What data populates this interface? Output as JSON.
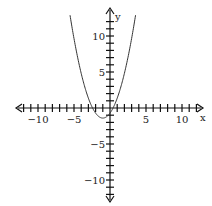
{
  "chart_data": {
    "type": "line",
    "title": "",
    "xlabel": "x",
    "ylabel": "y",
    "xlim": [
      -12,
      12
    ],
    "ylim": [
      -12,
      12
    ],
    "x_tick_labels": [
      "-10",
      "-5",
      "5",
      "10"
    ],
    "y_tick_labels": [
      "10",
      "5",
      "-5",
      "-10"
    ],
    "grid": false,
    "series": [
      {
        "name": "parabola",
        "function": "y = x^2 + 2x - 1",
        "vertex": [
          -1,
          -2
        ],
        "x_intercepts": [
          -2.41,
          0.41
        ],
        "y_intercept": -1
      }
    ]
  },
  "axes": {
    "x_label": "x",
    "y_label": "y",
    "x_ticks": [
      {
        "label": "-10",
        "value": -10
      },
      {
        "label": "-5",
        "value": -5
      },
      {
        "label": "5",
        "value": 5
      },
      {
        "label": "10",
        "value": 10
      }
    ],
    "y_ticks": [
      {
        "label": "10",
        "value": 10
      },
      {
        "label": "5",
        "value": 5
      },
      {
        "label": "-5",
        "value": -5
      },
      {
        "label": "-10",
        "value": -10
      }
    ]
  }
}
